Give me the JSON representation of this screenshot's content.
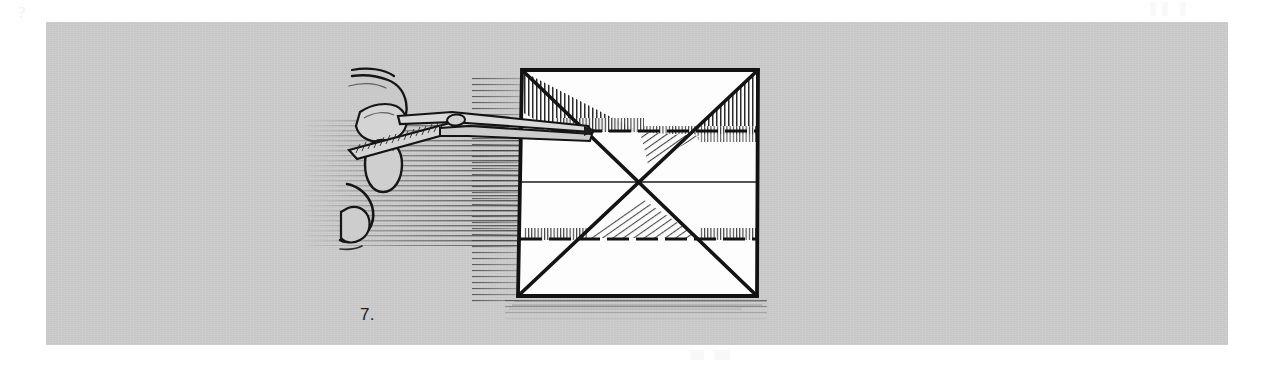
{
  "page": {
    "background_color": "#ffffff",
    "width": 1280,
    "height": 366
  },
  "illustration": {
    "panel_color": "#c9c9c9",
    "ink_color": "#1a1a1a",
    "paper_color": "#fdfdfd",
    "caption": "7.",
    "alt_description": "Line drawing of a hand holding a thin folding tool pointing at a square sheet of paper marked with diagonal crease folds forming an X and two horizontal dashed crease lines.",
    "subject": "origami folding step",
    "step_number": "7."
  },
  "objects": {
    "paper": {
      "name": "folded-paper-square",
      "corners": {
        "top_left": [
          522,
          70
        ],
        "top_right": [
          758,
          70
        ],
        "bottom_right": [
          757,
          296
        ],
        "bottom_left": [
          518,
          296
        ]
      },
      "creases": [
        "diagonal-top-left-to-bottom-right",
        "diagonal-top-right-to-bottom-left",
        "horizontal-upper-dashed",
        "horizontal-center",
        "horizontal-lower-dashed"
      ]
    },
    "hand": {
      "name": "hand-holding-tool",
      "fingers_visible": 2
    },
    "tool": {
      "name": "folding-tool",
      "type": "tweezers"
    }
  }
}
